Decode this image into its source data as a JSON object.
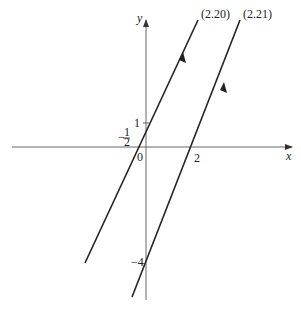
{
  "diagram": {
    "type": "coordinate-plot",
    "axes": {
      "x_label": "x",
      "y_label": "y",
      "origin_label": "0",
      "color": "#555555"
    },
    "ticks": {
      "y_one": "1",
      "y_minus_four": "−4",
      "x_two": "2",
      "x_minus_half_sign": "−",
      "x_minus_half_num": "1",
      "x_minus_half_den": "2"
    },
    "lines": [
      {
        "label": "(2.20)",
        "equation": "y = 2x + 1",
        "x_intercept": -0.5,
        "y_intercept": 1,
        "color": "#222222"
      },
      {
        "label": "(2.21)",
        "equation": "y = 2x − 4",
        "x_intercept": 2,
        "y_intercept": -4,
        "color": "#222222"
      }
    ]
  }
}
